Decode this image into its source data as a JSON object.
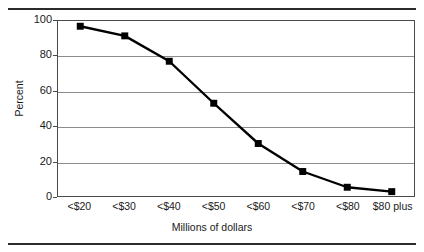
{
  "chart_data": {
    "type": "line",
    "title": "",
    "xlabel": "Millions of dollars",
    "ylabel": "Percent",
    "categories": [
      "<$20",
      "<$30",
      "<$40",
      "<$50",
      "<$60",
      "<$70",
      "<$80",
      "$80 plus"
    ],
    "values": [
      97,
      91.5,
      77,
      53,
      30,
      14,
      5,
      2.5
    ],
    "series": [
      {
        "name": "Percent",
        "values": [
          97,
          91.5,
          77,
          53,
          30,
          14,
          5,
          2.5
        ]
      }
    ],
    "ylim": [
      0,
      100
    ],
    "yticks": [
      0,
      20,
      40,
      60,
      80,
      100
    ],
    "ytick_labels": [
      "0",
      "20",
      "40",
      "60",
      "80",
      "100"
    ],
    "grid": "horizontal",
    "legend": "none",
    "marker": "square",
    "line_color": "#000000",
    "marker_color": "#000000",
    "grid_color": "#8c8c8c",
    "axis_color": "#4a4a4a",
    "background": "#ffffff"
  }
}
